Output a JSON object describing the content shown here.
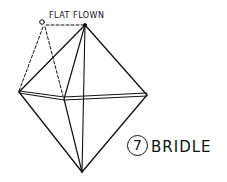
{
  "diagram": {
    "title": "BRIDLE",
    "step_number": "7",
    "annotation": "FLAT FLOWN",
    "stroke_color": "#111111",
    "background": "#ffffff",
    "vertices": {
      "top": [
        85,
        25
      ],
      "left": [
        19,
        92
      ],
      "right": [
        147,
        95
      ],
      "bottom": [
        82,
        172
      ],
      "center": [
        64,
        99
      ],
      "bridle_loop": [
        43,
        23
      ]
    }
  }
}
